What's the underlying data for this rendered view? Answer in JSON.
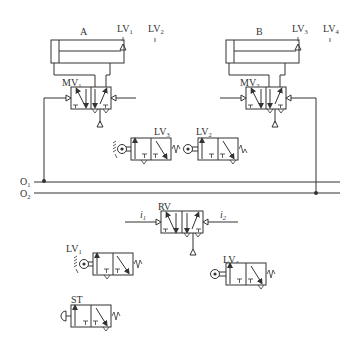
{
  "diagram": {
    "cylinders": [
      {
        "id": "A",
        "label": "A"
      },
      {
        "id": "B",
        "label": "B"
      }
    ],
    "limit_markers_top": [
      {
        "label": "LV",
        "sub": "1"
      },
      {
        "label": "LV",
        "sub": "2"
      },
      {
        "label": "LV",
        "sub": "3"
      },
      {
        "label": "LV",
        "sub": "4"
      }
    ],
    "main_valves": [
      {
        "label": "MV",
        "sub": "1"
      },
      {
        "label": "MV",
        "sub": "2"
      }
    ],
    "valves": {
      "lv3": {
        "label": "LV",
        "sub": "3"
      },
      "lv2": {
        "label": "LV",
        "sub": "2"
      },
      "rv": {
        "label": "RV"
      },
      "lv1": {
        "label": "LV",
        "sub": "1"
      },
      "lv4": {
        "label": "LV",
        "sub": "4"
      },
      "st": {
        "label": "ST"
      }
    },
    "lines": [
      {
        "label": "O",
        "sub": "1"
      },
      {
        "label": "O",
        "sub": "2"
      }
    ],
    "signals": [
      {
        "label": "i",
        "sub": "1"
      },
      {
        "label": "i",
        "sub": "2"
      }
    ],
    "colors": {
      "stroke": "#333333",
      "background": "#ffffff"
    }
  }
}
